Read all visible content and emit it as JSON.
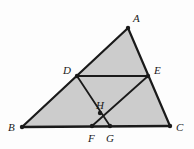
{
  "figure": {
    "canvas": {
      "width": 194,
      "height": 149
    },
    "background_color": "#fdfdfd",
    "shade_color": "#cccccc",
    "stroke_color": "#1a1a1a",
    "vertices": [
      {
        "id": "A",
        "label": "A",
        "x": 128,
        "y": 28,
        "label_x": 133,
        "label_y": 13,
        "dot": true
      },
      {
        "id": "B",
        "label": "B",
        "x": 22,
        "y": 127,
        "label_x": 8,
        "label_y": 122,
        "dot": true
      },
      {
        "id": "C",
        "label": "C",
        "x": 170,
        "y": 126,
        "label_x": 176,
        "label_y": 122,
        "dot": true
      },
      {
        "id": "D",
        "label": "D",
        "x": 77,
        "y": 76,
        "label_x": 63,
        "label_y": 65,
        "dot": true
      },
      {
        "id": "E",
        "label": "E",
        "x": 148,
        "y": 76,
        "label_x": 154,
        "label_y": 65,
        "dot": true
      },
      {
        "id": "F",
        "label": "F",
        "x": 92,
        "y": 126,
        "label_x": 88,
        "label_y": 133,
        "dot": true
      },
      {
        "id": "G",
        "label": "G",
        "x": 110,
        "y": 126,
        "label_x": 106,
        "label_y": 133,
        "dot": true
      },
      {
        "id": "H",
        "label": "H",
        "x": 100,
        "y": 113,
        "label_x": 96,
        "label_y": 100,
        "dot": true
      }
    ],
    "shaded_region": {
      "name": "triangle-abc-fill",
      "points": "128,28 170,126 22,127"
    },
    "segments": [
      {
        "name": "segment-AB",
        "from": "A",
        "to": "B",
        "width": 2.2
      },
      {
        "name": "segment-AC",
        "from": "A",
        "to": "C",
        "width": 2.2
      },
      {
        "name": "segment-BC",
        "from": "B",
        "to": "C",
        "width": 2.6
      },
      {
        "name": "segment-DE",
        "from": "D",
        "to": "E",
        "width": 2.0
      },
      {
        "name": "segment-DG",
        "from": "D",
        "to": "G",
        "width": 1.8
      },
      {
        "name": "segment-FE",
        "from": "F",
        "to": "E",
        "width": 1.8
      }
    ]
  }
}
